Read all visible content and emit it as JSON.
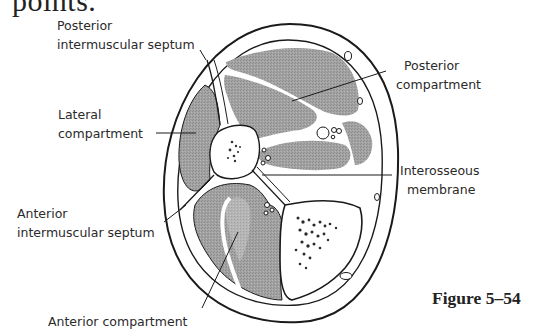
{
  "heading_fragment": "points.",
  "figure": {
    "caption": "Figure 5–54",
    "colors": {
      "outline": "#1a1a1a",
      "muscle_fill": "#9a9a9a",
      "bone_fill": "#ffffff",
      "background": "#ffffff"
    },
    "labels": {
      "posterior_intermuscular_septum": [
        "Posterior",
        "intermuscular septum"
      ],
      "lateral_compartment": [
        "Lateral",
        "compartment"
      ],
      "anterior_intermuscular_septum": [
        "Anterior",
        "intermuscular septum"
      ],
      "anterior_compartment": [
        "Anterior compartment"
      ],
      "posterior_compartment": [
        "Posterior",
        "compartment"
      ],
      "interosseous_membrane": [
        "Interosseous",
        "membrane"
      ]
    }
  }
}
